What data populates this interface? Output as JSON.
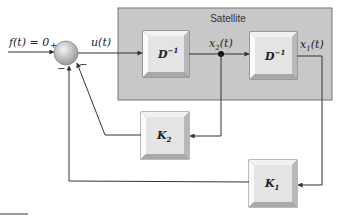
{
  "diagram": {
    "title": "Satellite",
    "input_label": "f(t) = 0",
    "summing_junction": {
      "signs": {
        "input": "+",
        "feedback_k1": "−",
        "feedback_k2": "−"
      }
    },
    "signals": {
      "u": "u(t)",
      "x2": {
        "base": "x",
        "sub": "2",
        "tail": "(t)"
      },
      "x1": {
        "base": "x",
        "sub": "1",
        "tail": "(t)"
      }
    },
    "blocks": {
      "d1": {
        "base": "D",
        "sup": "−1"
      },
      "d2": {
        "base": "D",
        "sup": "−1"
      },
      "k2": {
        "base": "K",
        "sub": "2"
      },
      "k1": {
        "base": "K",
        "sub": "1"
      }
    },
    "colors": {
      "satellite_fill": "#c8c8c8",
      "block_face": "#e4e4e4",
      "line": "#333333"
    }
  }
}
